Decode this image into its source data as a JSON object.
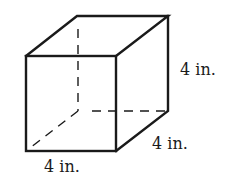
{
  "figure": {
    "type": "cube",
    "labels": {
      "height": "4 in.",
      "depth": "4 in.",
      "width": "4 in."
    },
    "colors": {
      "stroke": "#1a1a1a",
      "background": "#ffffff"
    }
  }
}
